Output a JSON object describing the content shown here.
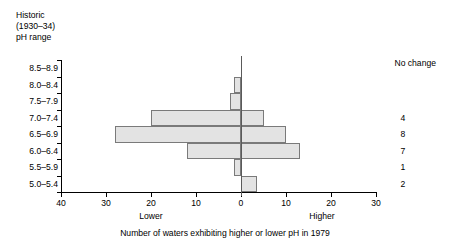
{
  "header": {
    "line1": "Historic",
    "line2": "(1930–34)",
    "line3": "pH range"
  },
  "annotation": {
    "title": "No change",
    "values": [
      "",
      "",
      "",
      "4",
      "8",
      "7",
      "1",
      "2"
    ]
  },
  "axis": {
    "lower_label": "Lower",
    "higher_label": "Higher",
    "caption": "Number of waters exhibiting higher or lower pH in 1979",
    "xticklabels": [
      "40",
      "30",
      "20",
      "10",
      "0",
      "10",
      "20",
      "30"
    ]
  },
  "chart_data": {
    "type": "bar",
    "orientation": "horizontal-diverging",
    "title": "",
    "subtitle": "",
    "xlabel": "Number of waters exhibiting higher or lower pH in 1979",
    "ylabel": "Historic (1930–34) pH range",
    "categories": [
      "8.5–8.9",
      "8.0–8.4",
      "7.5–7.9",
      "7.0–7.4",
      "6.5–6.9",
      "6.0–6.4",
      "5.5–5.9",
      "5.0–5.4"
    ],
    "series": [
      {
        "name": "Lower",
        "direction": "left",
        "values": [
          0,
          1.5,
          2.5,
          20,
          28,
          12,
          1.5,
          0
        ]
      },
      {
        "name": "Higher",
        "direction": "right",
        "values": [
          0,
          0,
          0,
          5,
          10,
          13,
          0,
          3.5
        ]
      }
    ],
    "no_change": [
      null,
      null,
      null,
      4,
      8,
      7,
      1,
      2
    ],
    "xlim": [
      -40,
      30
    ],
    "xticks": [
      -40,
      -30,
      -20,
      -10,
      0,
      10,
      20,
      30
    ],
    "xticklabels": [
      "40",
      "30",
      "20",
      "10",
      "0",
      "10",
      "20",
      "30"
    ],
    "grid": false,
    "legend": "none",
    "bar_fill_color": "#e3e3e3",
    "bar_edge_color": "#7a7a7a",
    "axis_color": "#000000"
  }
}
